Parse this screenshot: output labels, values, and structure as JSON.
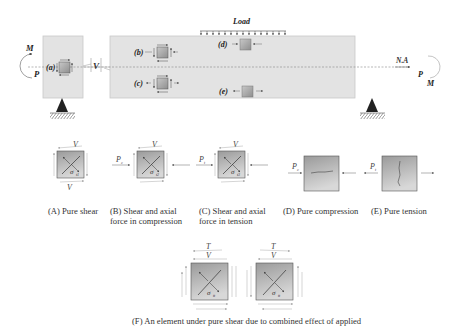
{
  "top_diagram": {
    "load_label": "Load",
    "neutral_axis_label": "N.A",
    "left_moment_label": "M",
    "left_axial_label": "P",
    "right_moment_label": "M",
    "right_axial_label": "P",
    "shear_label": "V",
    "elements": [
      {
        "id": "a",
        "label": "(a)"
      },
      {
        "id": "b",
        "label": "(b)"
      },
      {
        "id": "c",
        "label": "(c)"
      },
      {
        "id": "d",
        "label": "(d)"
      },
      {
        "id": "e",
        "label": "(e)"
      }
    ]
  },
  "stress_states": [
    {
      "id": "A",
      "caption_line1": "(A) Pure shear",
      "caption_line2": "",
      "top_label": "V",
      "bottom_label": "V",
      "sigma": "σ",
      "sigma_sub": "t1",
      "axial_label": ""
    },
    {
      "id": "B",
      "caption_line1": "(B) Shear and axial",
      "caption_line2": "force in compression",
      "top_label": "V",
      "sigma": "σ",
      "sigma_sub": "t2",
      "axial_label": "P",
      "axial_sub": "c"
    },
    {
      "id": "C",
      "caption_line1": "(C) Shear and axial",
      "caption_line2": "force in tension",
      "top_label": "V",
      "sigma": "σ",
      "sigma_sub": "t3",
      "axial_label": "P",
      "axial_sub": "t"
    },
    {
      "id": "D",
      "caption_line1": "(D) Pure compression",
      "caption_line2": "",
      "axial_label": "P",
      "axial_sub": "c"
    },
    {
      "id": "E",
      "caption_line1": "(E) Pure tension",
      "caption_line2": "",
      "axial_label": "P",
      "axial_sub": "t"
    }
  ],
  "combined": {
    "caption": "(F) An element under pure shear due to combined effect of applied",
    "elements": [
      {
        "top_label": "T",
        "second_label": "V",
        "sigma": "σ",
        "sigma_sub": "tt"
      },
      {
        "top_label": "T",
        "second_label": "V",
        "sigma": "σ",
        "sigma_sub": "tt"
      }
    ]
  }
}
